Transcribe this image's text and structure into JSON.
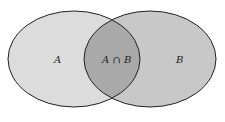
{
  "diagram": {
    "type": "venn",
    "sets": [
      {
        "id": "A",
        "label": "A"
      },
      {
        "id": "B",
        "label": "B"
      }
    ],
    "intersection": {
      "label": "A ∩ B"
    },
    "colors": {
      "background": "#ffffff",
      "set_a_fill": "#dcdcdc",
      "set_b_fill": "#c8c8c8",
      "intersection_fill": "#a9a9a9",
      "stroke": "#222222"
    }
  }
}
